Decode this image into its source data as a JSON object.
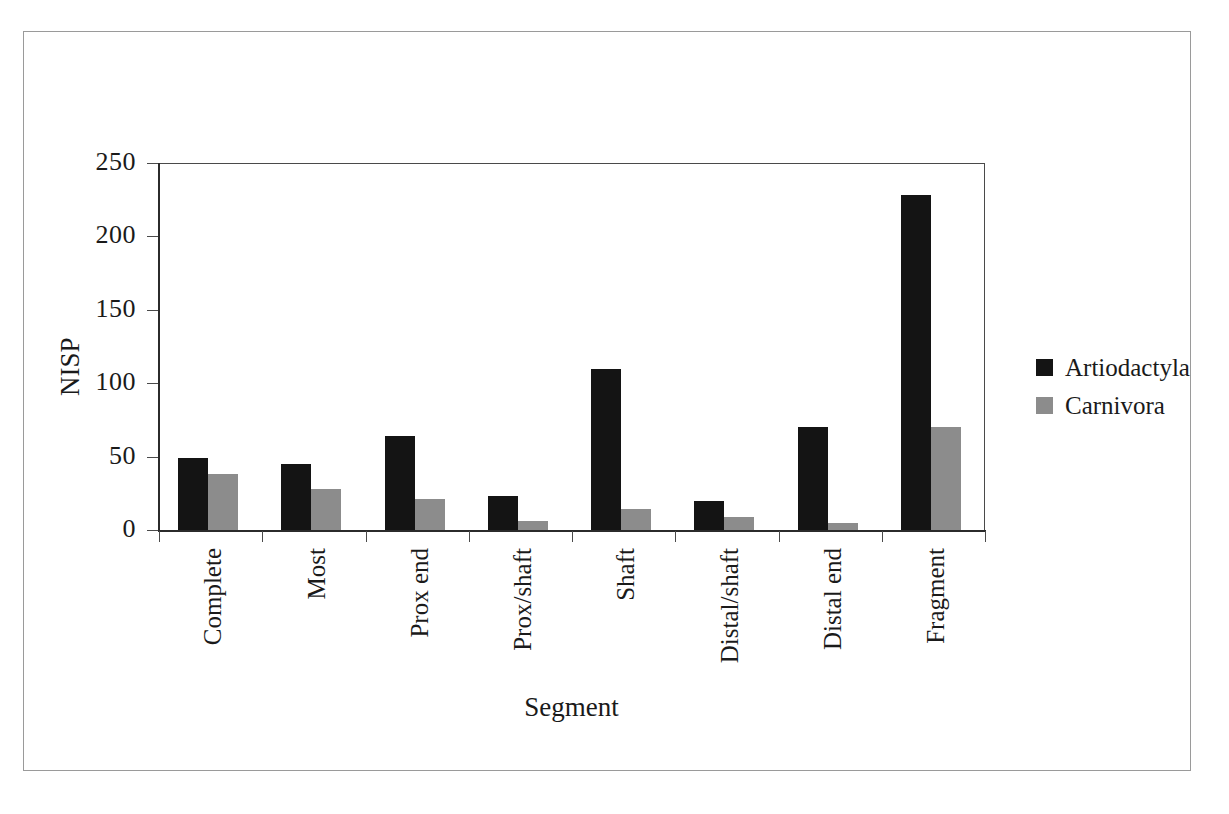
{
  "chart_data": {
    "type": "bar",
    "title": "",
    "xlabel": "Segment",
    "ylabel": "NISP",
    "categories": [
      "Complete",
      "Most",
      "Prox end",
      "Prox/shaft",
      "Shaft",
      "Distal/shaft",
      "Distal end",
      "Fragment"
    ],
    "series": [
      {
        "name": "Artiodactyla",
        "color": "#141414",
        "values": [
          49,
          45,
          64,
          23,
          110,
          20,
          70,
          228
        ]
      },
      {
        "name": "Carnivora",
        "color": "#8c8c8c",
        "values": [
          38,
          28,
          21,
          6,
          14,
          9,
          5,
          70
        ]
      }
    ],
    "ylim": [
      0,
      250
    ],
    "yticks": [
      0,
      50,
      100,
      150,
      200,
      250
    ],
    "ytick_labels": [
      "0",
      "50",
      "100",
      "150",
      "200",
      "250"
    ],
    "grid": false,
    "legend_position": "right"
  },
  "legend": {
    "entries": [
      {
        "label": "Artiodactyla",
        "swatch": "black-square-swatch"
      },
      {
        "label": "Carnivora",
        "swatch": "gray-square-swatch"
      }
    ]
  },
  "axes": {
    "y_title": "NISP",
    "x_title": "Segment"
  }
}
